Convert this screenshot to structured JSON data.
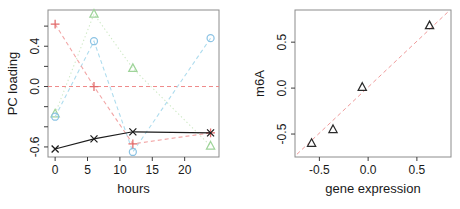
{
  "figure": {
    "background": "#ffffff",
    "box_color": "#8c8c8c",
    "tick_color": "#3c3c3c",
    "label_color": "#1a1a1a"
  },
  "chart_data": [
    {
      "type": "line",
      "panel": "left",
      "title": "",
      "xlabel": "hours",
      "ylabel": "PC loading",
      "xlim": [
        -1.1,
        25.3
      ],
      "ylim": [
        -0.7,
        0.76
      ],
      "grid": false,
      "xticks": [
        {
          "v": 0,
          "label": "0"
        },
        {
          "v": 5,
          "label": "5"
        },
        {
          "v": 10,
          "label": "10"
        },
        {
          "v": 15,
          "label": "15"
        },
        {
          "v": 20,
          "label": "20"
        }
      ],
      "yticks": [
        {
          "v": -0.6,
          "label": "-0.6"
        },
        {
          "v": -0.4,
          "label": ""
        },
        {
          "v": -0.2,
          "label": ""
        },
        {
          "v": 0.0,
          "label": "0.0"
        },
        {
          "v": 0.2,
          "label": ""
        },
        {
          "v": 0.4,
          "label": "0.4"
        },
        {
          "v": 0.6,
          "label": ""
        }
      ],
      "zero_line": {
        "y": 0,
        "color": "#ef8a8a",
        "style": "dashed"
      },
      "x": [
        0,
        6,
        12,
        24
      ],
      "series": [
        {
          "id": "green-triangle",
          "marker": "triangle",
          "marker_color": "#9fd49a",
          "line_color": "#cfe9c6",
          "style": "dotted",
          "values": [
            -0.27,
            0.72,
            0.18,
            -0.59
          ]
        },
        {
          "id": "blue-circle",
          "marker": "circle",
          "marker_color": "#8cc3e4",
          "line_color": "#aedcee",
          "style": "dashed",
          "values": [
            -0.3,
            0.45,
            -0.65,
            0.48
          ]
        },
        {
          "id": "red-plus",
          "marker": "plus",
          "marker_color": "#e26b6b",
          "line_color": "#f2a6a6",
          "style": "dashed",
          "values": [
            0.62,
            0.0,
            -0.57,
            -0.46
          ]
        },
        {
          "id": "black-x",
          "marker": "x",
          "marker_color": "#1c1c1c",
          "line_color": "#1c1c1c",
          "style": "solid",
          "values": [
            -0.62,
            -0.52,
            -0.45,
            -0.46
          ]
        }
      ]
    },
    {
      "type": "scatter",
      "panel": "right",
      "title": "",
      "xlabel": "gene expression",
      "ylabel": "m6A",
      "xlim": [
        -0.75,
        0.85
      ],
      "ylim": [
        -0.75,
        0.85
      ],
      "grid": false,
      "xticks": [
        {
          "v": -0.5,
          "label": "-0.5"
        },
        {
          "v": 0.0,
          "label": "0.0"
        },
        {
          "v": 0.5,
          "label": "0.5"
        }
      ],
      "yticks": [
        {
          "v": -0.5,
          "label": "-0.5"
        },
        {
          "v": 0.0,
          "label": "0.0"
        },
        {
          "v": 0.5,
          "label": "0.5"
        }
      ],
      "marker": "triangle",
      "marker_color": "#2a2a2a",
      "points": [
        [
          -0.58,
          -0.6
        ],
        [
          -0.36,
          -0.45
        ],
        [
          -0.06,
          0.01
        ],
        [
          0.63,
          0.68
        ]
      ],
      "fit_line": {
        "x1": -0.73,
        "y1": -0.72,
        "x2": 0.83,
        "y2": 0.84,
        "color": "#ef9a9a",
        "style": "dashed"
      }
    }
  ]
}
